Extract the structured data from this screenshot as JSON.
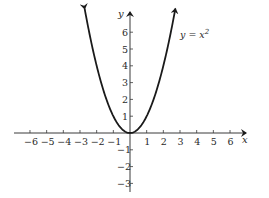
{
  "chart_data": {
    "type": "line",
    "title": "",
    "xlabel": "x",
    "ylabel": "y",
    "series": [
      {
        "name": "y = x^2",
        "label": "y = x",
        "label_sup": "2",
        "function": "x^2",
        "x": [
          -2.7,
          -2.5,
          -2,
          -1.5,
          -1,
          -0.5,
          0,
          0.5,
          1,
          1.5,
          2,
          2.5,
          2.7
        ],
        "y": [
          7.29,
          6.25,
          4,
          2.25,
          1,
          0.25,
          0,
          0.25,
          1,
          2.25,
          4,
          6.25,
          7.29
        ]
      }
    ],
    "xlim": [
      -6.9,
      7
    ],
    "ylim": [
      -3.5,
      7.3
    ],
    "x_ticks": [
      -6,
      -5,
      -4,
      -3,
      -2,
      -1,
      1,
      2,
      3,
      4,
      5,
      6
    ],
    "x_tick_labels": [
      "−6",
      "−5",
      "−4",
      "−3",
      "−2",
      "−1",
      "1",
      "2",
      "3",
      "4",
      "5",
      "6"
    ],
    "y_ticks": [
      6,
      5,
      4,
      3,
      2,
      1,
      -1,
      -2,
      -3
    ],
    "y_tick_labels": [
      "6",
      "5",
      "4",
      "3",
      "2",
      "1",
      "−1",
      "−2",
      "−3"
    ],
    "grid": false,
    "legend": "none",
    "annotations": [
      {
        "text": "y = x²",
        "near": [
          3,
          6.1
        ]
      }
    ]
  },
  "colors": {
    "curve": "#1a1a1a",
    "axes": "#3a3a3a",
    "text": "#2a2a2a"
  }
}
